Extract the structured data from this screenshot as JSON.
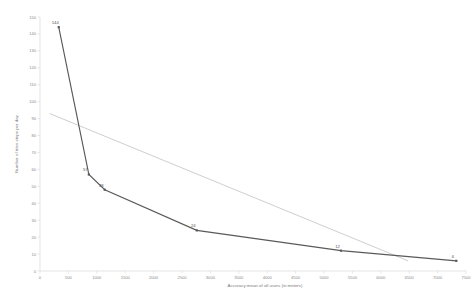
{
  "chart_data": {
    "type": "line",
    "title": "",
    "xlabel": "Accuracy mean of all users (in meters)",
    "ylabel": "Number of tries steps per day",
    "xlim": [
      0,
      7500
    ],
    "ylim": [
      0,
      150
    ],
    "grid": false,
    "legend": "none",
    "x_ticks": [
      "0",
      "500",
      "1000",
      "1500",
      "2000",
      "2500",
      "3000",
      "3500",
      "4000",
      "4500",
      "5000",
      "5500",
      "6000",
      "6500",
      "7000",
      "7500"
    ],
    "x_tick_values": [
      0,
      500,
      1000,
      1500,
      2000,
      2500,
      3000,
      3500,
      4000,
      4500,
      5000,
      5500,
      6000,
      6500,
      7000,
      7500
    ],
    "y_ticks": [
      "0",
      "10",
      "20",
      "30",
      "40",
      "50",
      "60",
      "70",
      "80",
      "90",
      "100",
      "110",
      "120",
      "130",
      "140",
      "150"
    ],
    "y_tick_values": [
      0,
      10,
      20,
      30,
      40,
      50,
      60,
      70,
      80,
      90,
      100,
      110,
      120,
      130,
      140,
      150
    ],
    "series": [
      {
        "name": "Number of tries steps per day",
        "color": "#5a5a5a",
        "x": [
          330,
          860,
          1140,
          2760,
          5300,
          7330
        ],
        "y": [
          144,
          57,
          48,
          24,
          12,
          6
        ],
        "point_labels": [
          "144",
          "57",
          "48",
          "24",
          "12",
          "6"
        ]
      },
      {
        "name": "Linear trendline",
        "color": "#bdbdbd",
        "style": "dotted",
        "x": [
          170,
          6480
        ],
        "y": [
          93,
          6
        ]
      }
    ]
  }
}
